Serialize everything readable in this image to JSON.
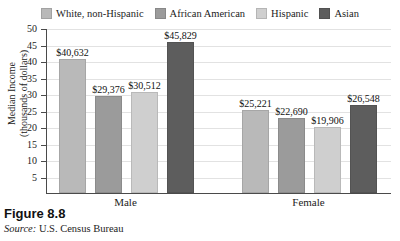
{
  "figure": {
    "number_label": "Figure 8.8",
    "source_prefix": "Source:",
    "source_text": "U.S. Census Bureau",
    "clipped_title_remnant": "............."
  },
  "legend": {
    "position": "top-center",
    "items": [
      {
        "label": "White, non-Hispanic",
        "color": "#b9b9b9",
        "swatch_icon": "legend-swatch-icon"
      },
      {
        "label": "African American",
        "color": "#9b9b9b",
        "swatch_icon": "legend-swatch-icon"
      },
      {
        "label": "Hispanic",
        "color": "#cfcfcf",
        "swatch_icon": "legend-swatch-icon"
      },
      {
        "label": "Asian",
        "color": "#5d5d5d",
        "swatch_icon": "legend-swatch-icon"
      }
    ]
  },
  "axis": {
    "y_title_line1": "Median Income",
    "y_title_line2": "(thousands of dollars)",
    "y_ticks": [
      "50",
      "45",
      "40",
      "35",
      "30",
      "25",
      "20",
      "15",
      "10",
      "5"
    ]
  },
  "chart_data": {
    "type": "bar",
    "title": "",
    "xlabel": "",
    "ylabel": "Median Income (thousands of dollars)",
    "ylim": [
      0,
      50
    ],
    "ytick_step": 5,
    "grid": true,
    "legend_position": "top",
    "units": "dollars",
    "value_label_format": "$#,###",
    "categories": [
      "Male",
      "Female"
    ],
    "series": [
      {
        "name": "White, non-Hispanic",
        "color": "#b9b9b9",
        "values": [
          40632,
          29376
        ],
        "value_labels": [
          "$40,632",
          "$29,376"
        ]
      },
      {
        "name": "African American",
        "color": "#9b9b9b",
        "values": [
          29376,
          22690
        ],
        "value_labels": [
          "$29,376",
          "$22,690"
        ]
      },
      {
        "name": "Hispanic",
        "color": "#cfcfcf",
        "values": [
          30512,
          19906
        ],
        "value_labels": [
          "$30,512",
          "$19,906"
        ]
      },
      {
        "name": "Asian",
        "color": "#5d5d5d",
        "values": [
          45829,
          26548
        ],
        "value_labels": [
          "$45,829",
          "$26,548"
        ]
      }
    ],
    "bars": [
      {
        "group": "Male",
        "series": "White, non-Hispanic",
        "value": 40632,
        "label": "$40,632",
        "color": "#b9b9b9"
      },
      {
        "group": "Male",
        "series": "African American",
        "value": 29376,
        "label": "$29,376",
        "color": "#9b9b9b"
      },
      {
        "group": "Male",
        "series": "Hispanic",
        "value": 30512,
        "label": "$30,512",
        "color": "#cfcfcf"
      },
      {
        "group": "Male",
        "series": "Asian",
        "value": 45829,
        "label": "$45,829",
        "color": "#5d5d5d"
      },
      {
        "group": "Female",
        "series": "White, non-Hispanic",
        "value": 25221,
        "label": "$25,221",
        "color": "#b9b9b9"
      },
      {
        "group": "Female",
        "series": "African American",
        "value": 22690,
        "label": "$22,690",
        "color": "#9b9b9b"
      },
      {
        "group": "Female",
        "series": "Hispanic",
        "value": 19906,
        "label": "$19,906",
        "color": "#cfcfcf"
      },
      {
        "group": "Female",
        "series": "Asian",
        "value": 26548,
        "label": "$26,548",
        "color": "#5d5d5d"
      }
    ]
  }
}
